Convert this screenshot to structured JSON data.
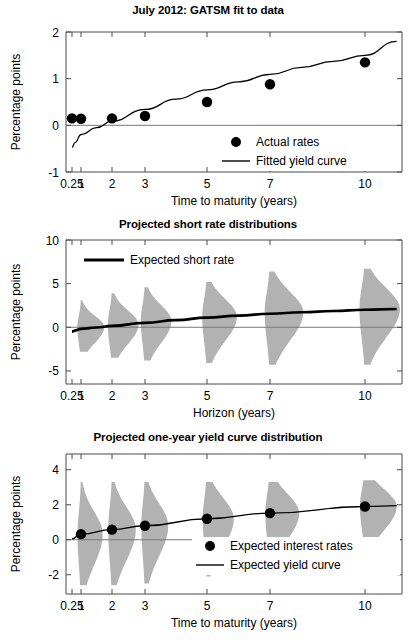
{
  "figure": {
    "width": 416,
    "height": 643,
    "background": "#ffffff",
    "ink": "#000000",
    "distribution_fill": "#b2b2b2",
    "axis_color": "#4a4a4a"
  },
  "panels": [
    {
      "id": "panel-top",
      "title": "July 2012: GATSM fit to data",
      "ylabel": "Percentage points",
      "xlabel": "Time to maturity (years)",
      "legend": [
        {
          "label": "Actual rates",
          "marker": "dot"
        },
        {
          "label": "Fitted yield curve",
          "marker": "line"
        }
      ]
    },
    {
      "id": "panel-mid",
      "title": "Projected short rate distributions",
      "ylabel": "Percentage points",
      "xlabel": "Horizon (years)",
      "legend": [
        {
          "label": "Expected short rate",
          "marker": "thick-line"
        }
      ]
    },
    {
      "id": "panel-bot",
      "title": "Projected one-year yield curve distribution",
      "ylabel": "Percentage points",
      "xlabel": "Time to maturity (years)",
      "legend": [
        {
          "label": "Expected interest rates",
          "marker": "dot"
        },
        {
          "label": "Expected yield curve",
          "marker": "line"
        }
      ]
    }
  ],
  "chart_data": [
    {
      "type": "scatter",
      "panel": "panel-top",
      "title": "July 2012: GATSM fit to data",
      "xlabel": "Time to maturity (years)",
      "ylabel": "Percentage points",
      "xticklabels": [
        "0.25",
        "1",
        "2",
        "3",
        "5",
        "7",
        "10"
      ],
      "x": [
        0.25,
        1,
        2,
        3,
        5,
        7,
        10
      ],
      "yticks": [
        -1,
        0,
        1,
        2
      ],
      "ylim": [
        -1,
        2
      ],
      "grid": false,
      "legend_position": "lower right",
      "series": [
        {
          "name": "Actual rates",
          "kind": "scatter",
          "values": [
            0.15,
            0.14,
            0.15,
            0.2,
            0.5,
            0.88,
            1.35
          ]
        },
        {
          "name": "Fitted yield curve",
          "kind": "line",
          "x": [
            0.25,
            0.5,
            1,
            1.5,
            2,
            3,
            4,
            5,
            6,
            7,
            8,
            9,
            10,
            11
          ],
          "values": [
            -0.47,
            -0.37,
            -0.2,
            -0.05,
            0.09,
            0.34,
            0.56,
            0.76,
            0.93,
            1.09,
            1.24,
            1.37,
            1.5,
            1.8
          ]
        }
      ]
    },
    {
      "type": "area",
      "panel": "panel-mid",
      "title": "Projected short rate distributions",
      "xlabel": "Horizon (years)",
      "ylabel": "Percentage points",
      "xticklabels": [
        "0.25",
        "1",
        "2",
        "3",
        "5",
        "7",
        "10"
      ],
      "x": [
        0.25,
        1,
        2,
        3,
        5,
        7,
        10
      ],
      "yticks": [
        -5,
        0,
        5,
        10
      ],
      "ylim": [
        -6.5,
        10
      ],
      "grid": false,
      "legend_position": "upper left",
      "series": [
        {
          "name": "Expected short rate",
          "kind": "line",
          "x": [
            0.25,
            0.5,
            1,
            1.5,
            2,
            3,
            4,
            5,
            6,
            7,
            8,
            9,
            10,
            11
          ],
          "values": [
            -0.5,
            -0.38,
            -0.18,
            -0.02,
            0.16,
            0.5,
            0.82,
            1.1,
            1.34,
            1.55,
            1.72,
            1.87,
            2.0,
            2.1
          ]
        }
      ],
      "distributions": [
        {
          "horizon": 1,
          "mode": 0.0,
          "lower": -2.8,
          "upper": 3.1,
          "halfwidth_years": 0.75
        },
        {
          "horizon": 2,
          "mode": 0.3,
          "lower": -3.5,
          "upper": 3.9,
          "halfwidth_years": 0.8
        },
        {
          "horizon": 3,
          "mode": 0.7,
          "lower": -3.8,
          "upper": 4.6,
          "halfwidth_years": 0.85
        },
        {
          "horizon": 5,
          "mode": 1.2,
          "lower": -4.1,
          "upper": 5.2,
          "halfwidth_years": 0.95
        },
        {
          "horizon": 7,
          "mode": 1.7,
          "lower": -4.3,
          "upper": 6.4,
          "halfwidth_years": 1.05
        },
        {
          "horizon": 10,
          "mode": 2.1,
          "lower": -4.3,
          "upper": 6.7,
          "halfwidth_years": 1.1
        }
      ]
    },
    {
      "type": "area",
      "panel": "panel-bot",
      "title": "Projected one-year yield curve distribution",
      "xlabel": "Time to maturity (years)",
      "ylabel": "Percentage points",
      "xticklabels": [
        "0.25",
        "1",
        "2",
        "3",
        "5",
        "7",
        "10"
      ],
      "x": [
        0.25,
        1,
        2,
        3,
        5,
        7,
        10
      ],
      "yticks": [
        -2,
        0,
        2,
        4
      ],
      "ylim": [
        -3.1,
        4.9
      ],
      "grid": false,
      "legend_position": "lower right",
      "series": [
        {
          "name": "Expected interest rates",
          "kind": "scatter",
          "x": [
            1,
            2,
            3,
            5,
            7,
            10
          ],
          "values": [
            0.32,
            0.58,
            0.8,
            1.2,
            1.52,
            1.9
          ]
        },
        {
          "name": "Expected yield curve",
          "kind": "line",
          "x": [
            0.25,
            1,
            2,
            3,
            5,
            7,
            10,
            11
          ],
          "values": [
            0.05,
            0.32,
            0.58,
            0.8,
            1.2,
            1.52,
            1.9,
            1.95
          ]
        }
      ],
      "distributions": [
        {
          "horizon": 1,
          "mode": 0.32,
          "lower": -2.6,
          "upper": 3.3,
          "halfwidth_years": 0.7
        },
        {
          "horizon": 2,
          "mode": 0.58,
          "lower": -2.6,
          "upper": 3.3,
          "halfwidth_years": 0.72
        },
        {
          "horizon": 3,
          "mode": 0.8,
          "lower": -2.5,
          "upper": 3.3,
          "halfwidth_years": 0.75
        },
        {
          "horizon": 5,
          "mode": 1.2,
          "lower": -2.1,
          "upper": 3.3,
          "halfwidth_years": 0.85
        },
        {
          "horizon": 7,
          "mode": 1.52,
          "lower": -1.7,
          "upper": 3.3,
          "halfwidth_years": 0.92
        },
        {
          "horizon": 10,
          "mode": 1.9,
          "lower": -1.1,
          "upper": 3.4,
          "halfwidth_years": 1.0
        }
      ]
    }
  ]
}
